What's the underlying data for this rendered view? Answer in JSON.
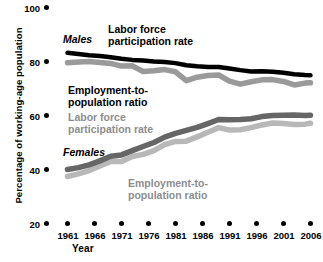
{
  "chart_data": {
    "type": "line",
    "title": "",
    "xlabel": "Year",
    "ylabel": "Percentage of working-age population",
    "xlim": [
      1961,
      2006
    ],
    "ylim": [
      20,
      100
    ],
    "grid": false,
    "legend_position": "inline-annotations",
    "x_ticks": [
      "1961",
      "1966",
      "1971",
      "1976",
      "1981",
      "1986",
      "1991",
      "1996",
      "2001",
      "2006"
    ],
    "y_ticks": [
      "20",
      "40",
      "60",
      "80",
      "100"
    ],
    "x": [
      1961,
      1963,
      1965,
      1967,
      1969,
      1971,
      1973,
      1975,
      1977,
      1979,
      1981,
      1983,
      1985,
      1987,
      1989,
      1991,
      1993,
      1995,
      1997,
      1999,
      2001,
      2003,
      2005,
      2006
    ],
    "series": [
      {
        "name": "Males — Labor force participation rate",
        "group": "Males",
        "measure": "Labor force participation rate",
        "color": "#000000",
        "values": [
          83.2,
          82.8,
          82.3,
          82.0,
          81.6,
          81.0,
          80.6,
          80.4,
          80.0,
          79.8,
          79.4,
          78.6,
          78.2,
          78.0,
          78.0,
          77.4,
          76.8,
          76.3,
          76.4,
          76.2,
          75.8,
          75.3,
          75.0,
          74.9
        ]
      },
      {
        "name": "Males — Employment-to-population ratio",
        "group": "Males",
        "measure": "Employment-to-population ratio",
        "color": "#9a9a9a",
        "values": [
          79.5,
          79.8,
          80.0,
          79.6,
          79.3,
          78.3,
          78.4,
          76.3,
          76.6,
          77.0,
          76.2,
          72.9,
          74.2,
          74.8,
          75.0,
          72.7,
          71.6,
          72.5,
          73.2,
          73.3,
          72.6,
          71.3,
          72.0,
          72.1
        ]
      },
      {
        "name": "Females — Labor force participation rate",
        "group": "Females",
        "measure": "Labor force participation rate",
        "color": "#666666",
        "values": [
          40.0,
          40.7,
          41.7,
          43.2,
          44.9,
          45.4,
          47.0,
          48.5,
          50.0,
          52.0,
          53.4,
          54.5,
          55.6,
          57.0,
          58.5,
          58.4,
          58.5,
          58.8,
          59.6,
          60.0,
          60.1,
          60.2,
          60.0,
          60.1
        ]
      },
      {
        "name": "Females — Employment-to-population ratio",
        "group": "Females",
        "measure": "Employment-to-population ratio",
        "color": "#b8b8b8",
        "values": [
          37.4,
          38.4,
          39.6,
          41.3,
          43.0,
          43.0,
          44.8,
          45.6,
          47.0,
          49.2,
          50.4,
          50.5,
          52.1,
          53.8,
          55.5,
          54.6,
          54.7,
          55.5,
          56.5,
          57.2,
          57.0,
          56.7,
          56.8,
          57.1
        ]
      }
    ],
    "annotations": [
      {
        "id": "males-group-label",
        "text": "Males",
        "style": "italic-bold-black"
      },
      {
        "id": "females-group-label",
        "text": "Females",
        "style": "italic-bold-black"
      },
      {
        "id": "males-lfp-label-line1",
        "text": "Labor force",
        "style": "bold-black"
      },
      {
        "id": "males-lfp-label-line2",
        "text": "participation rate",
        "style": "bold-black"
      },
      {
        "id": "males-epop-label-line1",
        "text": "Employment-to-",
        "style": "bold-black"
      },
      {
        "id": "males-epop-label-line2",
        "text": "population ratio",
        "style": "bold-black"
      },
      {
        "id": "females-lfp-label-line1",
        "text": "Labor force",
        "style": "bold-gray"
      },
      {
        "id": "females-lfp-label-line2",
        "text": "participation rate",
        "style": "bold-gray"
      },
      {
        "id": "females-epop-label-line1",
        "text": "Employment-to-",
        "style": "bold-gray"
      },
      {
        "id": "females-epop-label-line2",
        "text": "population ratio",
        "style": "bold-gray"
      }
    ]
  },
  "colors": {
    "background": "#ffffff",
    "males_lfp": "#000000",
    "males_epop": "#9a9a9a",
    "females_lfp": "#666666",
    "females_epop": "#b8b8b8",
    "text": "#000000",
    "gray_text": "#8d8d8d"
  }
}
